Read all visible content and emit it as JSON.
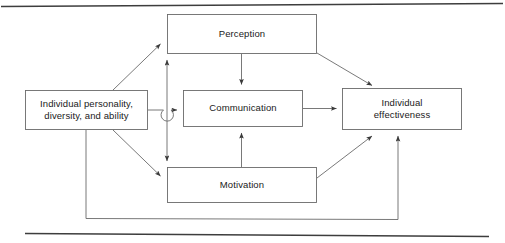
{
  "figure": {
    "type": "block-flow-diagram",
    "background_color": "#ffffff",
    "line_color": "#4d4d4d",
    "text_color": "#1a1a1a",
    "box_fill": "#ffffff",
    "rules": {
      "top_rule": "",
      "bottom_rule": ""
    }
  },
  "nodes": {
    "individual_personality": {
      "label": "Individual personality,\ndiversity, and ability"
    },
    "perception": {
      "label": "Perception"
    },
    "communication": {
      "label": "Communication"
    },
    "motivation": {
      "label": "Motivation"
    },
    "individual_effectiveness": {
      "label": "Individual\neffectiveness"
    }
  },
  "edges": [
    {
      "from": "individual_personality",
      "to": "perception",
      "style": "diagonal-arrow"
    },
    {
      "from": "individual_personality",
      "to": "communication",
      "style": "horizontal-arrow-with-line-hop"
    },
    {
      "from": "individual_personality",
      "to": "motivation",
      "style": "diagonal-arrow"
    },
    {
      "from": "perception",
      "to": "communication",
      "style": "vertical-arrow"
    },
    {
      "from": "motivation",
      "to": "communication",
      "style": "vertical-arrow"
    },
    {
      "from": "communication",
      "to": "perception",
      "style": "vertical-arrow-left-spine"
    },
    {
      "from": "communication",
      "to": "motivation",
      "style": "vertical-arrow-left-spine"
    },
    {
      "from": "perception",
      "to": "individual_effectiveness",
      "style": "diagonal-arrow"
    },
    {
      "from": "communication",
      "to": "individual_effectiveness",
      "style": "horizontal-arrow"
    },
    {
      "from": "motivation",
      "to": "individual_effectiveness",
      "style": "diagonal-arrow"
    },
    {
      "from": "individual_effectiveness",
      "to": "individual_personality",
      "style": "feedback-loop-bottom"
    }
  ]
}
